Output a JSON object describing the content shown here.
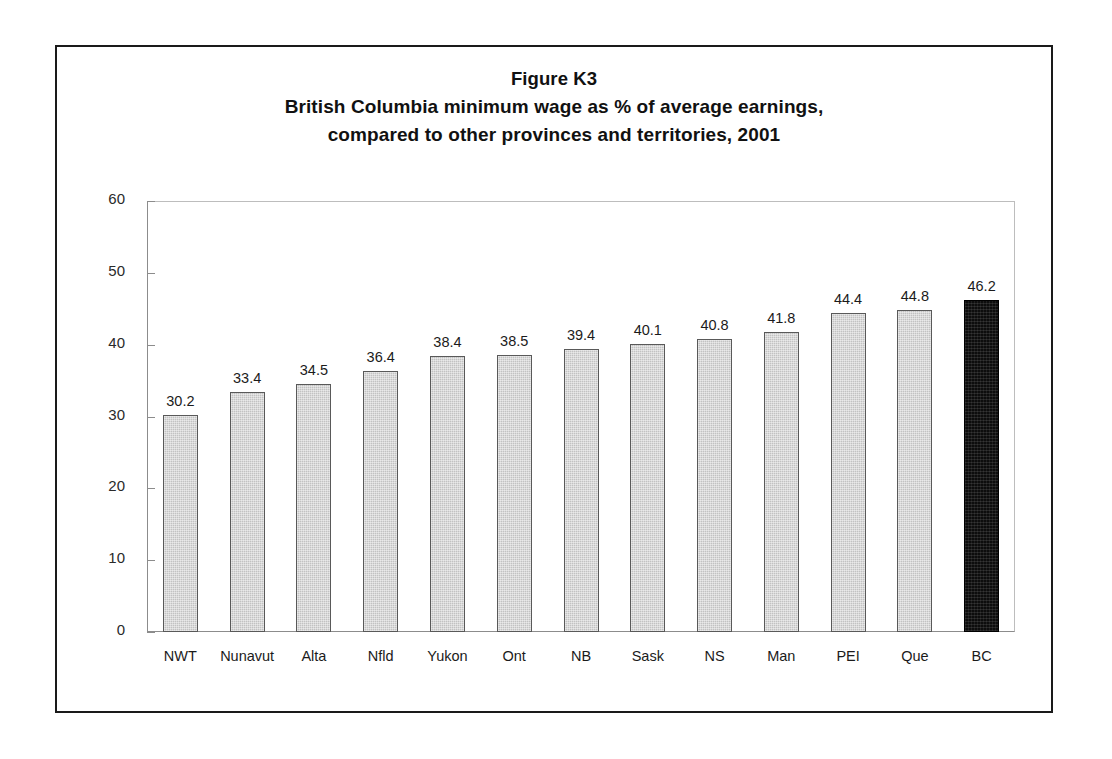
{
  "figure": {
    "title_lines": [
      "Figure K3",
      "British Columbia minimum wage as % of average earnings,",
      "compared to other provinces and territories, 2001"
    ]
  },
  "chart_data": {
    "type": "bar",
    "title": "Figure K3\nBritish Columbia minimum wage as % of average earnings, compared to other provinces and territories, 2001",
    "xlabel": "",
    "ylabel": "",
    "ylim": [
      0,
      60
    ],
    "yticks": [
      0,
      10,
      20,
      30,
      40,
      50,
      60
    ],
    "ytick_labels": [
      "0",
      "10",
      "20",
      "30",
      "40",
      "50",
      "60"
    ],
    "grid": false,
    "legend": "none",
    "categories": [
      "NWT",
      "Nunavut",
      "Alta",
      "Nfld",
      "Yukon",
      "Ont",
      "NB",
      "Sask",
      "NS",
      "Man",
      "PEI",
      "Que",
      "BC"
    ],
    "values": [
      30.2,
      33.4,
      34.5,
      36.4,
      38.4,
      38.5,
      39.4,
      40.1,
      40.8,
      41.8,
      44.4,
      44.8,
      46.2
    ],
    "value_labels": [
      "30.2",
      "33.4",
      "34.5",
      "36.4",
      "38.4",
      "38.5",
      "39.4",
      "40.1",
      "40.8",
      "41.8",
      "44.4",
      "44.8",
      "46.2"
    ],
    "highlight_category": "BC",
    "colors": {
      "bar_fill": "#c2c2c2",
      "bar_border": "#595959",
      "highlight_fill": "#0d0d0d",
      "highlight_border": "#000000",
      "axis": "#8c8c8c",
      "frame": "#1a1a1a",
      "text": "#1b1b1b"
    }
  }
}
